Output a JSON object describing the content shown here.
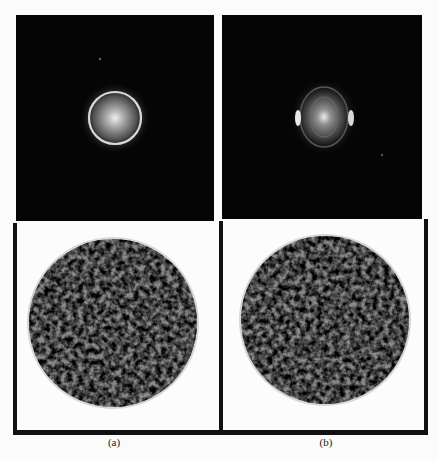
{
  "figure": {
    "panels": [
      {
        "id": "a",
        "caption": "(a)",
        "top": "diffraction pattern with single bright circular ring around bright center",
        "bottom": "reconstructed particle density map (grayscale, roughly circular)"
      },
      {
        "id": "b",
        "caption": "(b)",
        "top": "diffraction pattern with faint rings and two bright side arcs",
        "bottom": "reconstructed particle density map (grayscale, roughly circular)"
      }
    ],
    "colors": {
      "background": "#fbfbfb",
      "frame": "#111111",
      "pattern_bg": "#050505"
    }
  }
}
